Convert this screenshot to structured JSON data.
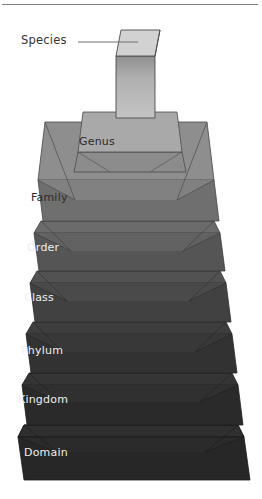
{
  "diagram": {
    "type": "3d-stacked-pyramid",
    "rank_count": 8,
    "orientation": "narrowest at top, widest at bottom",
    "top_rule": {
      "name": "header-divider",
      "color": "#808080"
    },
    "background": "#ffffff",
    "callout": {
      "label": "Species",
      "leader_line_color": "#6e6e6e",
      "points_to": "species-block"
    },
    "levels": [
      {
        "id": "species",
        "label": "Species",
        "label_position": "external-callout",
        "label_color": "#333333",
        "top_face_color": "#d2d2d2",
        "front_face_color": "#b5b5b5",
        "front_face_color_dark": "#8f8f8f",
        "edge_color": "#4a4a4a",
        "shape": "column"
      },
      {
        "id": "genus",
        "label": "Genus",
        "label_position": "on-slab",
        "label_color": "#2b2b2b",
        "top_face_color": "#a9a9a9",
        "front_face_color": "#8c8c8c",
        "bevel_color": "#9b9b9b",
        "edge_color": "#4a4a4a",
        "shape": "trapezoid-slab"
      },
      {
        "id": "family",
        "label": "Family",
        "label_position": "on-slab",
        "label_color": "#2b2b2b",
        "top_face_color": "#8e8e8e",
        "front_face_color": "#6f6f6f",
        "bevel_color": "#818181",
        "edge_color": "#464646",
        "shape": "beveled-slab"
      },
      {
        "id": "order",
        "label": "Order",
        "label_position": "on-slab",
        "label_color": "#ececec",
        "top_face_color": "#6b6b6b",
        "front_face_color": "#555555",
        "bevel_color": "#626262",
        "edge_color": "#3a3a3a",
        "shape": "beveled-slab"
      },
      {
        "id": "class",
        "label": "Class",
        "label_position": "on-slab",
        "label_color": "#ececec",
        "top_face_color": "#525252",
        "front_face_color": "#414141",
        "bevel_color": "#4a4a4a",
        "edge_color": "#2e2e2e",
        "shape": "beveled-slab"
      },
      {
        "id": "phylum",
        "label": "Phylum",
        "label_position": "on-slab",
        "label_color": "#ececec",
        "top_face_color": "#3e3e3e",
        "front_face_color": "#323232",
        "bevel_color": "#383838",
        "edge_color": "#252525",
        "shape": "beveled-slab"
      },
      {
        "id": "kingdom",
        "label": "Kingdom",
        "label_position": "on-slab",
        "label_color": "#ececec",
        "top_face_color": "#353535",
        "front_face_color": "#2a2a2a",
        "bevel_color": "#303030",
        "edge_color": "#1f1f1f",
        "shape": "beveled-slab"
      },
      {
        "id": "domain",
        "label": "Domain",
        "label_position": "on-slab",
        "label_color": "#ececec",
        "top_face_color": "#2f2f2f",
        "front_face_color": "#272727",
        "bevel_color": "#2b2b2b",
        "edge_color": "#1a1a1a",
        "shape": "beveled-slab"
      }
    ]
  }
}
